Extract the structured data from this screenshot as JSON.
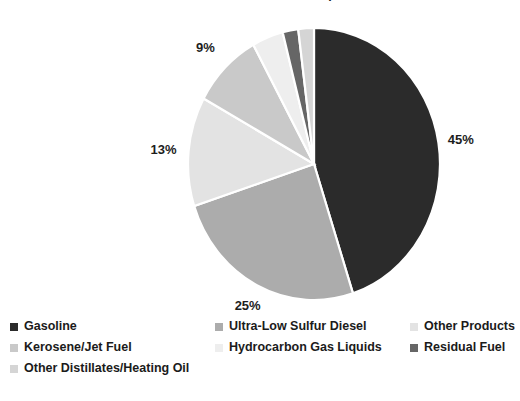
{
  "chart_data": {
    "type": "pie",
    "title": "Petroleum Product Consumption",
    "xlabel": "",
    "ylabel": "",
    "grid": false,
    "legend_position": "bottom",
    "value_suffix": "%",
    "categories": [
      "Gasoline",
      "Ultra-Low Sulfur Diesel",
      "Other Products",
      "Kerosene/Jet Fuel",
      "Hydrocarbon Gas Liquids",
      "Residual Fuel",
      "Other Distillates/Heating Oil"
    ],
    "values": [
      45,
      25,
      13,
      9,
      4,
      2,
      2
    ],
    "labels": [
      "45%",
      "25%",
      "13%",
      "9%",
      "4%",
      "2%",
      "2%"
    ],
    "colors": [
      "#2b2b2b",
      "#acacac",
      "#e3e3e3",
      "#c9c9c9",
      "#eeeeee",
      "#666666",
      "#d5d5d5"
    ]
  },
  "legend": {
    "items": [
      {
        "label": "Gasoline",
        "color": "#2b2b2b"
      },
      {
        "label": "Ultra-Low Sulfur Diesel",
        "color": "#acacac"
      },
      {
        "label": "Other Products",
        "color": "#e3e3e3"
      },
      {
        "label": "Kerosene/Jet Fuel",
        "color": "#c9c9c9"
      },
      {
        "label": "Hydrocarbon Gas Liquids",
        "color": "#eeeeee"
      },
      {
        "label": "Residual Fuel",
        "color": "#666666"
      },
      {
        "label": "Other Distillates/Heating Oil",
        "color": "#d5d5d5"
      }
    ]
  }
}
